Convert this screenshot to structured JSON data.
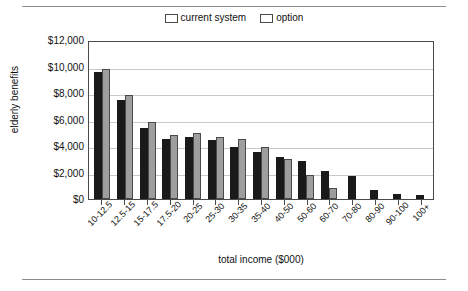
{
  "chart_data": {
    "type": "bar",
    "title": "",
    "xlabel": "total income ($000)",
    "ylabel": "elderly benefits",
    "ylim": [
      0,
      12000
    ],
    "ytick_labels": [
      "$12,000",
      "$10,000",
      "$8,000",
      "$6,000",
      "$4,000",
      "$2,000",
      "$0"
    ],
    "ytick_values": [
      12000,
      10000,
      8000,
      6000,
      4000,
      2000,
      0
    ],
    "grid": true,
    "legend_position": "top-center",
    "categories": [
      "10-12.5",
      "12.5-15",
      "15-17.5",
      "17.5-20",
      "20-25",
      "25-30",
      "30-35",
      "35-40",
      "40-50",
      "50-60",
      "60-70",
      "70-80",
      "80-90",
      "90-100",
      "100+"
    ],
    "series": [
      {
        "name": "current system",
        "color": "#1a1a1a",
        "values": [
          9600,
          7500,
          5350,
          4500,
          4650,
          4450,
          3950,
          3550,
          3200,
          2900,
          2100,
          1700,
          650,
          400,
          280
        ]
      },
      {
        "name": "option",
        "color": "#9e9e9e",
        "values": [
          9850,
          7850,
          5800,
          4800,
          4950,
          4700,
          4550,
          3900,
          3050,
          1850,
          800,
          0,
          0,
          0,
          0
        ]
      }
    ]
  },
  "legend": {
    "entries": [
      {
        "label": "current system"
      },
      {
        "label": "option"
      }
    ]
  }
}
